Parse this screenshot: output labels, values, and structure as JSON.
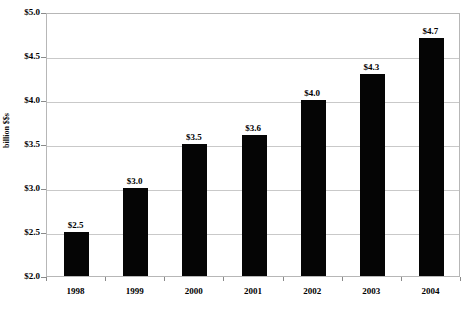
{
  "chart_data": {
    "type": "bar",
    "title": "",
    "xlabel": "",
    "ylabel": "billion $$s",
    "categories": [
      "1998",
      "1999",
      "2000",
      "2001",
      "2002",
      "2003",
      "2004"
    ],
    "values": [
      2.5,
      3.0,
      3.5,
      3.6,
      4.0,
      4.3,
      4.7
    ],
    "data_labels": [
      "$2.5",
      "$3.0",
      "$3.5",
      "$3.6",
      "$4.0",
      "$4.3",
      "$4.7"
    ],
    "ylim": [
      2.0,
      5.0
    ],
    "ytick_values": [
      2.0,
      2.5,
      3.0,
      3.5,
      4.0,
      4.5,
      5.0
    ],
    "ytick_labels": [
      "$2.0",
      "$2.5",
      "$3.0",
      "$3.5",
      "$4.0",
      "$4.5",
      "$5.0"
    ],
    "grid": true,
    "legend": false,
    "legend_position": "none",
    "series": [
      {
        "name": "billion $$s",
        "color": "#050505",
        "values": [
          2.5,
          3.0,
          3.5,
          3.6,
          4.0,
          4.3,
          4.7
        ]
      }
    ],
    "colors": {
      "bar": "#050505",
      "gridline": "#c9c9c9",
      "axis": "#b7b7b7",
      "background": "#ffffff",
      "text": "#000000"
    }
  }
}
